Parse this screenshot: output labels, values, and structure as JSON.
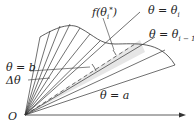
{
  "diagram": {
    "labels": {
      "theta_i": "θ = θ",
      "theta_i_sub": "i",
      "theta_i_minus_1": "θ = θ",
      "theta_i_minus_1_sub": "i − 1",
      "f_theta_star": "f(θ",
      "f_theta_star_sub": "i",
      "f_theta_star_sup": "*",
      "f_theta_star_close": ")",
      "theta_b": "θ = b",
      "theta_a": "θ = a",
      "delta_theta": "Δθ",
      "origin": "O"
    },
    "colors": {
      "stroke": "#333333",
      "highlight": "#e6e6e6"
    }
  }
}
